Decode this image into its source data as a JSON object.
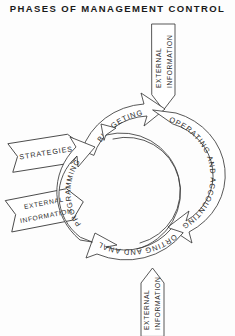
{
  "title": "PHASES OF MANAGEMENT CONTROL",
  "cycle": {
    "phases": [
      {
        "id": "budgeting",
        "label": "BUDGETING",
        "position": "top"
      },
      {
        "id": "operating-and-accounting",
        "label": "OPERATING AND ACCOUNTING",
        "position": "right"
      },
      {
        "id": "reporting-and-analysis",
        "label": "REPORTING AND ANALYSIS",
        "position": "bottom"
      },
      {
        "id": "programming",
        "label": "PROGRAMMING",
        "position": "left"
      }
    ],
    "direction": "clockwise",
    "feedback_arrow": {
      "id": "feedback",
      "from": "reporting-and-analysis",
      "to": "budgeting",
      "label": ""
    }
  },
  "inputs": [
    {
      "id": "external-information-top",
      "lines": [
        "EXTERNAL",
        "INFORMATION"
      ],
      "text": "EXTERNAL INFORMATION",
      "direction": "down",
      "target": "budgeting"
    },
    {
      "id": "strategies",
      "lines": [
        "STRATEGIES"
      ],
      "text": "STRATEGIES",
      "direction": "right",
      "target": "programming"
    },
    {
      "id": "external-information-left",
      "lines": [
        "EXTERNAL",
        "INFORMATION"
      ],
      "text": "EXTERNAL INFORMATION",
      "direction": "right",
      "target": "programming"
    },
    {
      "id": "external-information-bottom",
      "lines": [
        "EXTERNAL",
        "INFORMATION"
      ],
      "text": "EXTERNAL INFORMATION",
      "direction": "up",
      "target": "reporting-and-analysis"
    }
  ],
  "colors": {
    "background": "#fdfdfd",
    "stroke": "#3a3a3a",
    "text": "#2b2b2b",
    "fill": "#ffffff"
  }
}
